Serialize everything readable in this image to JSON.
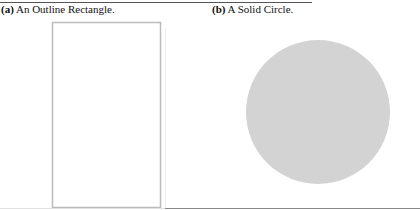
{
  "figure": {
    "top_clipped_text": "",
    "panels": [
      {
        "id": "a",
        "tag": "(a)",
        "caption": " An Outline Rectangle.",
        "shape": {
          "type": "rectangle",
          "style": "outline",
          "x": 52,
          "y": 22,
          "width": 108,
          "height": 185,
          "stroke": "#bbbbbb",
          "fill": "none"
        }
      },
      {
        "id": "b",
        "tag": "(b)",
        "caption": " A Solid Circle.",
        "shape": {
          "type": "circle",
          "style": "solid",
          "cx": 318,
          "cy": 112,
          "r": 72,
          "fill": "#d3d3d3",
          "stroke": "none"
        }
      }
    ]
  },
  "colors": {
    "rect_stroke": "#bbbbbb",
    "circle_fill": "#d3d3d3",
    "rule": "#555555"
  }
}
